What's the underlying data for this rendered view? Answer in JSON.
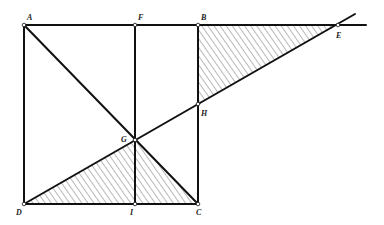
{
  "diagram": {
    "points": {
      "A": {
        "label": "A",
        "x": 24,
        "y": 25
      },
      "F": {
        "label": "F",
        "x": 135,
        "y": 25
      },
      "B": {
        "label": "B",
        "x": 198,
        "y": 25
      },
      "E": {
        "label": "E",
        "x": 338,
        "y": 25
      },
      "H": {
        "label": "H",
        "x": 198,
        "y": 104
      },
      "G": {
        "label": "G",
        "x": 135,
        "y": 140
      },
      "D": {
        "label": "D",
        "x": 24,
        "y": 204
      },
      "I": {
        "label": "I",
        "x": 135,
        "y": 204
      },
      "C": {
        "label": "C",
        "x": 198,
        "y": 204
      }
    },
    "shaded_regions": [
      "triangle BHE",
      "triangle DGC"
    ],
    "line_color": "#111111",
    "hatch_color": "#333333"
  }
}
